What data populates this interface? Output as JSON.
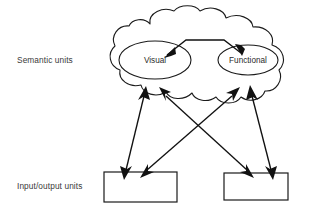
{
  "diagram": {
    "type": "schematic",
    "title": "",
    "row_labels": {
      "semantic": "Semantic units",
      "input_output": "Input/output units"
    },
    "cloud": {
      "name": "semantic-units-cloud",
      "shape": "cloud",
      "contains": [
        "Visual",
        "Functional"
      ]
    },
    "nodes": [
      {
        "id": "visual",
        "label": "Visual",
        "shape": "ellipse"
      },
      {
        "id": "functional",
        "label": "Functional",
        "shape": "ellipse"
      }
    ],
    "boxes": [
      {
        "id": "io-box-left",
        "label": ""
      },
      {
        "id": "io-box-right",
        "label": ""
      }
    ],
    "connections": [
      {
        "from": "visual",
        "to": "functional",
        "style": "double-arrow"
      },
      {
        "from": "io-box-left",
        "to": "semantic-units-cloud",
        "style": "double-arrow"
      },
      {
        "from": "io-box-left",
        "to": "semantic-units-cloud",
        "style": "double-arrow"
      },
      {
        "from": "io-box-right",
        "to": "semantic-units-cloud",
        "style": "double-arrow"
      },
      {
        "from": "io-box-right",
        "to": "semantic-units-cloud",
        "style": "double-arrow"
      }
    ],
    "colors": {
      "stroke": "#1a1a1a",
      "background": "#ffffff",
      "text": "#2a2a2a"
    }
  }
}
